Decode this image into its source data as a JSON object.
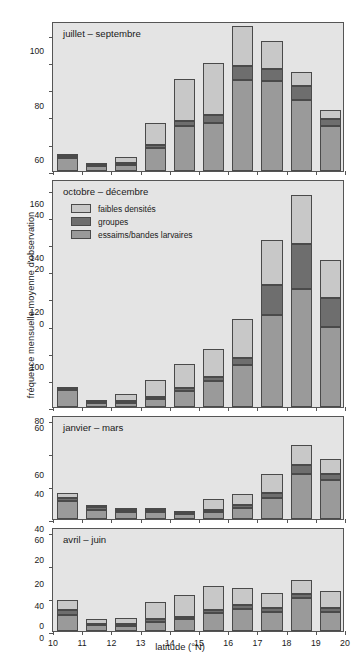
{
  "chart_data": {
    "type": "bar",
    "subtype": "stacked-bar-small-multiples",
    "title": "",
    "xlabel": "latitude (°N)",
    "ylabel": "fréquence mensuelle moyenne d'observation",
    "grid": false,
    "legend_position": "inside-panel-2-top-left",
    "categories": [
      "10",
      "11",
      "12",
      "13",
      "14",
      "15",
      "16",
      "17",
      "18",
      "19",
      "20"
    ],
    "bin_labels": [
      "10-11",
      "11-12",
      "12-13",
      "13-14",
      "14-15",
      "15-16",
      "16-17",
      "17-18",
      "18-19",
      "19-20"
    ],
    "series_names": [
      "essaims/bandes larvaires",
      "groupes",
      "faibles densités"
    ],
    "series_colors": [
      "#9a9a9a",
      "#6e6e6e",
      "#c8c8c8"
    ],
    "panels": [
      {
        "name": "juillet-septembre",
        "title": "juillet – septembre",
        "ylim": [
          0,
          110
        ],
        "yticks": [
          0,
          20,
          40,
          60,
          80,
          100
        ],
        "series": [
          {
            "name": "essaims/bandes larvaires",
            "values": [
              9.5,
              3.5,
              4.5,
              17,
              33,
              35,
              67,
              66,
              52,
              33
            ]
          },
          {
            "name": "groupes",
            "values": [
              1.5,
              1.0,
              1.5,
              2,
              4,
              6,
              10,
              9,
              10,
              5
            ]
          },
          {
            "name": "faibles densités",
            "values": [
              0.5,
              0.5,
              4,
              16.5,
              30.5,
              38,
              29,
              20,
              10.5,
              7
            ]
          }
        ],
        "totals": [
          11.5,
          5,
          10,
          35.5,
          67.5,
          79,
          106,
          95,
          72.5,
          45
        ]
      },
      {
        "name": "octobre-decembre",
        "title": "octobre – décembre",
        "ylim": [
          0,
          168
        ],
        "yticks": [
          0,
          20,
          40,
          60,
          80,
          100,
          120,
          140,
          160
        ],
        "series": [
          {
            "name": "essaims/bandes larvaires",
            "values": [
              12.5,
              3,
              3,
              6,
              12,
              19,
              31,
              68,
              87,
              59
            ]
          },
          {
            "name": "groupes",
            "values": [
              1,
              1,
              1.5,
              1.5,
              2,
              3,
              5,
              22,
              33,
              21
            ]
          },
          {
            "name": "faibles densités",
            "values": [
              0.5,
              1,
              5,
              12.5,
              18,
              21,
              29,
              33,
              36,
              28
            ]
          }
        ],
        "totals": [
          14,
          5,
          9.5,
          20,
          32,
          43,
          65,
          123,
          156,
          108
        ]
      },
      {
        "name": "janvier-mars",
        "title": "janvier – mars",
        "ylim": [
          0,
          63
        ],
        "yticks": [
          0,
          20,
          40,
          60
        ],
        "series": [
          {
            "name": "essaims/bandes larvaires",
            "values": [
              11,
              5.5,
              4.5,
              4.5,
              3,
              4,
              6.5,
              13,
              27.5,
              23.5
            ]
          },
          {
            "name": "groupes",
            "values": [
              2,
              1.5,
              0.8,
              0.8,
              0.6,
              1.5,
              2,
              2.5,
              5.5,
              4
            ]
          },
          {
            "name": "faibles densités",
            "values": [
              3,
              1.5,
              0.7,
              0.7,
              0.4,
              6.5,
              6.5,
              11.5,
              12,
              9
            ]
          }
        ],
        "totals": [
          16,
          8.5,
          6,
          6,
          4,
          12,
          15,
          27,
          45,
          36.5
        ]
      },
      {
        "name": "avril-juin",
        "title": "avril – juin",
        "ylim": [
          0,
          63
        ],
        "yticks": [
          0,
          20,
          40,
          60
        ],
        "series": [
          {
            "name": "essaims/bandes larvaires",
            "values": [
              10,
              3.5,
              3,
              5.5,
              7,
              11,
              13.5,
              11.5,
              20,
              11.5
            ]
          },
          {
            "name": "groupes",
            "values": [
              2.5,
              1,
              1,
              1.5,
              1.5,
              2,
              2.5,
              2.5,
              2.5,
              2.5
            ]
          },
          {
            "name": "faibles densités",
            "values": [
              6,
              2.5,
              4,
              10.5,
              13.5,
              14,
              10,
              9,
              8.5,
              10
            ]
          }
        ],
        "totals": [
          18.5,
          7,
          8,
          17.5,
          22,
          27,
          26,
          23,
          31,
          24
        ]
      }
    ],
    "legend": [
      {
        "label": "faibles densités",
        "color": "#c8c8c8"
      },
      {
        "label": "groupes",
        "color": "#6e6e6e"
      },
      {
        "label": "essaims/bandes larvaires",
        "color": "#9a9a9a"
      }
    ]
  },
  "axis": {
    "xlabel": "latitude (°N)",
    "ylabel": "fréquence mensuelle moyenne d'observation"
  }
}
